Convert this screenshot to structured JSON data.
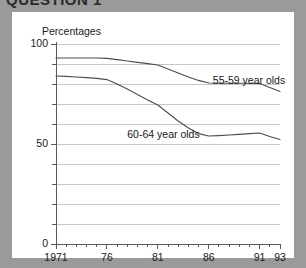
{
  "heading": "QUESTION 1",
  "chart_data": {
    "type": "line",
    "title": "",
    "subtitle": "",
    "ylabel": "Percentages",
    "xlabel": "",
    "ylim": [
      0,
      100
    ],
    "xlim": [
      1971,
      1993
    ],
    "y_ticks_labeled": [
      "0",
      "50",
      "100"
    ],
    "y_tick_values_labeled": [
      0,
      50,
      100
    ],
    "y_gridline_values": [
      10,
      20,
      30,
      40,
      50,
      60,
      70,
      80,
      90,
      100
    ],
    "y_minor_tick_values": [
      10,
      20,
      30,
      40,
      60,
      70,
      80,
      90
    ],
    "x_tick_labels": [
      "1971",
      "76",
      "81",
      "86",
      "91",
      "93"
    ],
    "x_tick_values": [
      1971,
      1976,
      1981,
      1986,
      1991,
      1993
    ],
    "grid": true,
    "legend_position": "inline-annotations",
    "line_color": "#4d4d4d",
    "grid_color": "#c8c8c8",
    "axis_color": "#5a5a5a",
    "background": "#ffffff",
    "page_background": "#9a9a9a",
    "series": [
      {
        "name": "55-59 year olds",
        "label": "55-59 year olds",
        "label_x": 1986.4,
        "label_y": 81.5,
        "x": [
          1971,
          1972,
          1973,
          1974,
          1975,
          1976,
          1977,
          1978,
          1979,
          1980,
          1981,
          1982,
          1983,
          1984,
          1985,
          1986,
          1987,
          1988,
          1989,
          1990,
          1991,
          1992,
          1993
        ],
        "values": [
          93,
          93,
          93,
          93,
          93,
          92.8,
          92.2,
          91.5,
          90.8,
          90.2,
          89.5,
          87.5,
          85.5,
          83.5,
          81.8,
          80.5,
          80.4,
          80.4,
          80.4,
          80.4,
          80.3,
          78.2,
          76.2
        ]
      },
      {
        "name": "60-64 year olds",
        "label": "60-64 year olds",
        "label_x": 1978.0,
        "label_y": 54.5,
        "x": [
          1971,
          1972,
          1973,
          1974,
          1975,
          1976,
          1977,
          1978,
          1979,
          1980,
          1981,
          1982,
          1983,
          1984,
          1985,
          1986,
          1987,
          1988,
          1989,
          1990,
          1991,
          1992,
          1993
        ],
        "values": [
          84,
          83.8,
          83.5,
          83.2,
          82.8,
          82.2,
          80.0,
          77.5,
          74.8,
          72.0,
          69.5,
          65.5,
          61.5,
          58.0,
          55.2,
          54.0,
          54.2,
          54.5,
          54.8,
          55.2,
          55.5,
          53.8,
          52.2
        ]
      }
    ]
  }
}
